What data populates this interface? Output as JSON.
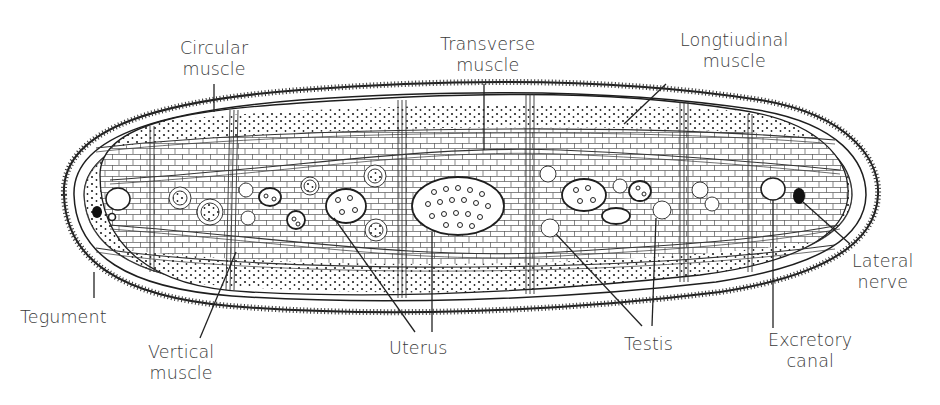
{
  "diagram": {
    "labels": {
      "circular_muscle": [
        "Circular",
        "muscle"
      ],
      "transverse_muscle": [
        "Transverse",
        "muscle"
      ],
      "longitudinal_muscle": [
        "Longtiudinal",
        "muscle"
      ],
      "lateral_nerve": [
        "Lateral",
        "nerve"
      ],
      "tegument": [
        "Tegument"
      ],
      "vertical_muscle": [
        "Vertical",
        "muscle"
      ],
      "uterus": [
        "Uterus"
      ],
      "testis": [
        "Testis"
      ],
      "excretory_canal": [
        "Excretory",
        "canal"
      ]
    },
    "colors": {
      "ink": "#1e1e1e",
      "label_text": "#3a3a3a",
      "background": "#ffffff"
    }
  }
}
